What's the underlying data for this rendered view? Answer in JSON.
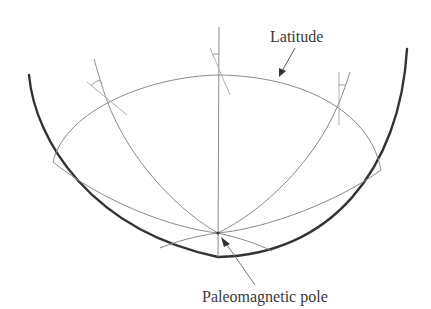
{
  "figure": {
    "type": "stereographic-projection-hemisphere",
    "labels": {
      "latitude": "Latitude",
      "pole": "Paleomagnetic pole"
    },
    "colors": {
      "background": "#ffffff",
      "outer_circle": "#333333",
      "construction_lines": "#8a8a8a",
      "text": "#3a3a3a"
    },
    "elements": {
      "outer_circle_arc": "primitive circle (lower hemisphere)",
      "latitude_circle": "small circle of latitude",
      "meridians": [
        "left meridian",
        "central meridian",
        "right meridian"
      ],
      "pole_point": "paleomagnetic pole"
    }
  }
}
